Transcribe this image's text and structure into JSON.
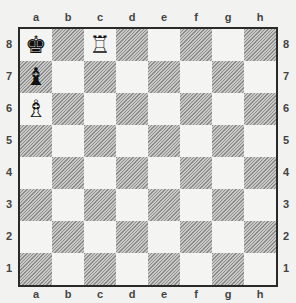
{
  "board": {
    "files": [
      "a",
      "b",
      "c",
      "d",
      "e",
      "f",
      "g",
      "h"
    ],
    "ranks": [
      "8",
      "7",
      "6",
      "5",
      "4",
      "3",
      "2",
      "1"
    ],
    "colors": {
      "light": "#f4f4f2",
      "dark_hatched": "#8c8c8c",
      "border": "#2a2a2a"
    },
    "pieces": [
      {
        "square": "a8",
        "piece": "black-king",
        "glyph": "♚"
      },
      {
        "square": "c8",
        "piece": "white-rook",
        "glyph": "♖"
      },
      {
        "square": "a7",
        "piece": "black-bishop",
        "glyph": "♝"
      },
      {
        "square": "a6",
        "piece": "white-bishop",
        "glyph": "♗"
      }
    ]
  }
}
